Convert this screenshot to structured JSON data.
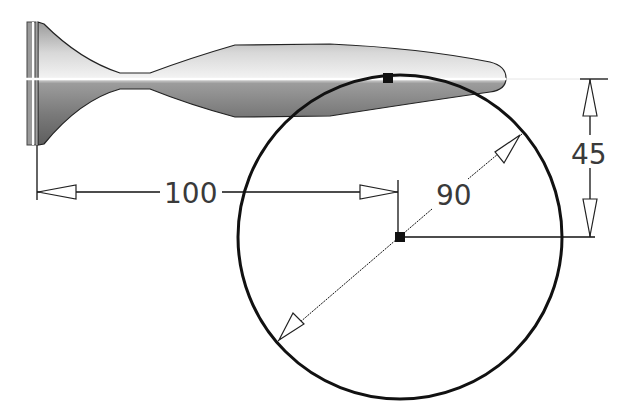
{
  "drawing": {
    "type": "CAD sketch with dimensions",
    "part": "revolved profile (fish-shaped body)",
    "dimensions": {
      "horizontal": {
        "value": "100",
        "label": "100"
      },
      "diameter": {
        "value": "90",
        "label": "90"
      },
      "vertical": {
        "value": "45",
        "label": "45"
      }
    },
    "circle": {
      "center": [
        400,
        237
      ],
      "radius": 162
    },
    "colors": {
      "line": "#111111",
      "text": "#3a3a3a",
      "body_light": "#f4f4f4",
      "body_dark": "#6e6e6e",
      "centerline": "#ffffff"
    }
  }
}
